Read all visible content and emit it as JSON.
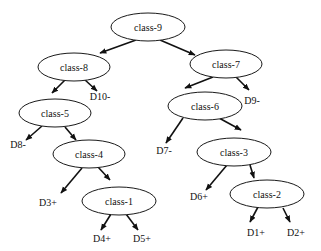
{
  "diagram": {
    "type": "binary-tree",
    "nodes": [
      {
        "id": "class-9",
        "label": "class-9",
        "cx": 148,
        "cy": 27,
        "rx": 37,
        "ry": 14
      },
      {
        "id": "class-8",
        "label": "class-8",
        "cx": 74,
        "cy": 67,
        "rx": 36,
        "ry": 14
      },
      {
        "id": "class-7",
        "label": "class-7",
        "cx": 226,
        "cy": 64,
        "rx": 36,
        "ry": 14
      },
      {
        "id": "class-5",
        "label": "class-5",
        "cx": 55,
        "cy": 113,
        "rx": 36,
        "ry": 14
      },
      {
        "id": "class-6",
        "label": "class-6",
        "cx": 205,
        "cy": 106,
        "rx": 37,
        "ry": 14
      },
      {
        "id": "class-4",
        "label": "class-4",
        "cx": 89,
        "cy": 154,
        "rx": 36,
        "ry": 14
      },
      {
        "id": "class-3",
        "label": "class-3",
        "cx": 234,
        "cy": 152,
        "rx": 37,
        "ry": 14
      },
      {
        "id": "class-1",
        "label": "class-1",
        "cx": 119,
        "cy": 201,
        "rx": 37,
        "ry": 14
      },
      {
        "id": "class-2",
        "label": "class-2",
        "cx": 267,
        "cy": 194,
        "rx": 37,
        "ry": 14
      }
    ],
    "leaves": [
      {
        "id": "D10-",
        "label": "D10-",
        "x": 100,
        "y": 100
      },
      {
        "id": "D9-",
        "label": "D9-",
        "x": 252,
        "y": 104
      },
      {
        "id": "D8-",
        "label": "D8-",
        "x": 18,
        "y": 148
      },
      {
        "id": "D7-",
        "label": "D7-",
        "x": 164,
        "y": 154
      },
      {
        "id": "D3+",
        "label": "D3+",
        "x": 48,
        "y": 206
      },
      {
        "id": "D6+",
        "label": "D6+",
        "x": 199,
        "y": 200
      },
      {
        "id": "D4+",
        "label": "D4+",
        "x": 102,
        "y": 242
      },
      {
        "id": "D5+",
        "label": "D5+",
        "x": 142,
        "y": 242
      },
      {
        "id": "D1+",
        "label": "D1+",
        "x": 256,
        "y": 236
      },
      {
        "id": "D2+",
        "label": "D2+",
        "x": 296,
        "y": 236
      }
    ],
    "edges": [
      {
        "from": "class-9",
        "to": "class-8",
        "x1": 136,
        "y1": 40,
        "x2": 100,
        "y2": 53
      },
      {
        "from": "class-9",
        "to": "class-7",
        "x1": 160,
        "y1": 40,
        "x2": 195,
        "y2": 55
      },
      {
        "from": "class-8",
        "to": "class-5",
        "x1": 65,
        "y1": 80,
        "x2": 52,
        "y2": 93
      },
      {
        "from": "class-8",
        "to": "D10-",
        "x1": 84,
        "y1": 79,
        "x2": 97,
        "y2": 91
      },
      {
        "from": "class-7",
        "to": "class-6",
        "x1": 213,
        "y1": 77,
        "x2": 185,
        "y2": 88
      },
      {
        "from": "class-7",
        "to": "D9-",
        "x1": 236,
        "y1": 77,
        "x2": 249,
        "y2": 90
      },
      {
        "from": "class-5",
        "to": "D8-",
        "x1": 42,
        "y1": 126,
        "x2": 26,
        "y2": 140
      },
      {
        "from": "class-5",
        "to": "class-4",
        "x1": 65,
        "y1": 127,
        "x2": 76,
        "y2": 140
      },
      {
        "from": "class-6",
        "to": "D7-",
        "x1": 183,
        "y1": 118,
        "x2": 166,
        "y2": 143
      },
      {
        "from": "class-6",
        "to": "class-3",
        "x1": 219,
        "y1": 118,
        "x2": 241,
        "y2": 130
      },
      {
        "from": "class-4",
        "to": "D3+",
        "x1": 82,
        "y1": 168,
        "x2": 61,
        "y2": 193
      },
      {
        "from": "class-4",
        "to": "class-1",
        "x1": 98,
        "y1": 167,
        "x2": 110,
        "y2": 180
      },
      {
        "from": "class-3",
        "to": "D6+",
        "x1": 227,
        "y1": 165,
        "x2": 206,
        "y2": 190
      },
      {
        "from": "class-3",
        "to": "class-2",
        "x1": 250,
        "y1": 165,
        "x2": 254,
        "y2": 178
      },
      {
        "from": "class-1",
        "to": "D4+",
        "x1": 111,
        "y1": 214,
        "x2": 101,
        "y2": 230
      },
      {
        "from": "class-1",
        "to": "D5+",
        "x1": 126,
        "y1": 214,
        "x2": 138,
        "y2": 230
      },
      {
        "from": "class-2",
        "to": "D1+",
        "x1": 258,
        "y1": 207,
        "x2": 250,
        "y2": 222
      },
      {
        "from": "class-2",
        "to": "D2+",
        "x1": 283,
        "y1": 208,
        "x2": 290,
        "y2": 222
      }
    ]
  }
}
